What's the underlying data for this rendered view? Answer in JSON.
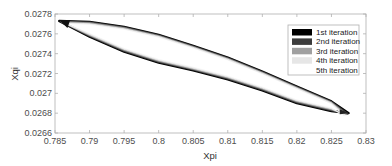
{
  "chart_data": {
    "type": "line",
    "title": "",
    "xlabel": "Xpi",
    "ylabel": "Xqi",
    "xlim": [
      0.785,
      0.83
    ],
    "ylim": [
      0.0266,
      0.0278
    ],
    "xticks": [
      "0.785",
      "0.79",
      "0.795",
      "0.8",
      "0.805",
      "0.81",
      "0.815",
      "0.82",
      "0.825",
      "0.83"
    ],
    "yticks": [
      "0.0266",
      "0.0268",
      "0.027",
      "0.0272",
      "0.0274",
      "0.0276",
      "0.0278"
    ],
    "grid": false,
    "legend_position": "upper right",
    "series": [
      {
        "name": "1st iteration",
        "color": "#000000",
        "width": 1.0
      },
      {
        "name": "2nd iteration",
        "color": "#404040",
        "width": 0.8
      },
      {
        "name": "3rd iteration",
        "color": "#9a9a9a",
        "width": 0.6
      },
      {
        "name": "4th iteration",
        "color": "#e2e2e2",
        "width": 0.5
      },
      {
        "name": "5th iteration",
        "color": "#ffffff",
        "width": 0.4
      }
    ],
    "loop_outline": {
      "upper": {
        "x": [
          0.7856,
          0.79,
          0.793,
          0.795,
          0.8,
          0.805,
          0.81,
          0.815,
          0.82,
          0.825,
          0.8275
        ],
        "y": [
          0.02773,
          0.02772,
          0.02769,
          0.02767,
          0.02759,
          0.02748,
          0.02736,
          0.02722,
          0.02707,
          0.02692,
          0.0268
        ]
      },
      "lower": {
        "x": [
          0.7856,
          0.79,
          0.795,
          0.8,
          0.805,
          0.81,
          0.815,
          0.82,
          0.825,
          0.8275
        ],
        "y": [
          0.02773,
          0.02757,
          0.02742,
          0.02731,
          0.02723,
          0.02714,
          0.02703,
          0.0269,
          0.02682,
          0.0268
        ]
      }
    }
  },
  "legend": {
    "items": [
      {
        "label": "1st iteration",
        "swatch": "#000000"
      },
      {
        "label": "2nd iteration",
        "swatch": "#3c3c3c"
      },
      {
        "label": "3rd iteration",
        "swatch": "#a0a0a0"
      },
      {
        "label": "4th iteration",
        "swatch": "#e6e6e6"
      },
      {
        "label": "5th iteration",
        "swatch": "#ffffff"
      }
    ]
  },
  "axes": {
    "xlabel": "Xpi",
    "ylabel": "Xqi"
  }
}
